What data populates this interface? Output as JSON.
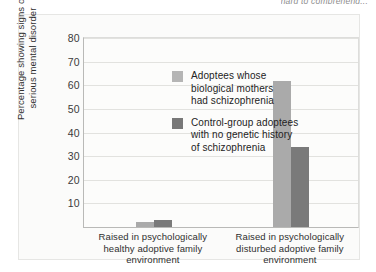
{
  "top_caption": "hard to comprehend...",
  "chart_data": {
    "type": "bar",
    "title": "",
    "xlabel": "",
    "ylabel": "Percentage showing signs\nof serious mental disorder",
    "ylim": [
      0,
      80
    ],
    "yticks": [
      10,
      20,
      30,
      40,
      50,
      60,
      70,
      80
    ],
    "grid": true,
    "legend_position": "inside-upper-left",
    "categories": [
      "Raised in psychologically\nhealthy adoptive family\nenvironment",
      "Raised in psychologically\ndisturbed adoptive family\nenvironment"
    ],
    "series": [
      {
        "name": "Adoptees whose\nbiological mothers\nhad schizophrenia",
        "color": "#aaaaaa",
        "values": [
          2,
          62
        ]
      },
      {
        "name": "Control-group adoptees\nwith no genetic history\nof schizophrenia",
        "color": "#7a7a7a",
        "values": [
          3,
          34
        ]
      }
    ]
  }
}
